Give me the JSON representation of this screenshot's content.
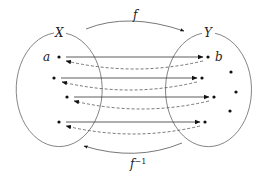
{
  "diagram": {
    "type": "function-mapping",
    "sets": [
      {
        "id": "X",
        "label": "X",
        "center": [
          59,
          88
        ],
        "rx": 43,
        "ry": 57
      },
      {
        "id": "Y",
        "label": "Y",
        "center": [
          211,
          88
        ],
        "rx": 43,
        "ry": 57
      }
    ],
    "domain_points": [
      {
        "label": "a",
        "pos": [
          59,
          57
        ]
      },
      {
        "label": "",
        "pos": [
          54,
          78
        ]
      },
      {
        "label": "",
        "pos": [
          67,
          97
        ]
      },
      {
        "label": "",
        "pos": [
          59,
          122
        ]
      }
    ],
    "codomain_points": [
      {
        "label": "b",
        "pos": [
          208,
          57
        ]
      },
      {
        "label": "",
        "pos": [
          202,
          78
        ]
      },
      {
        "label": "",
        "pos": [
          214,
          97
        ]
      },
      {
        "label": "",
        "pos": [
          205,
          122
        ]
      }
    ],
    "extra_codomain_points": [
      {
        "pos": [
          231,
          72
        ]
      },
      {
        "pos": [
          236,
          92
        ]
      },
      {
        "pos": [
          230,
          111
        ]
      }
    ],
    "maps": {
      "forward": {
        "label": "f",
        "style": "solid"
      },
      "inverse": {
        "label": "f",
        "superscript": "−1",
        "style": "dashed"
      }
    },
    "colors": {
      "stroke": "#555555",
      "ink": "#111111"
    }
  },
  "labels": {
    "set_x": "X",
    "set_y": "Y",
    "point_a": "a",
    "point_b": "b",
    "forward_map": "f",
    "inverse_map": "f",
    "inverse_sup": "−1"
  }
}
